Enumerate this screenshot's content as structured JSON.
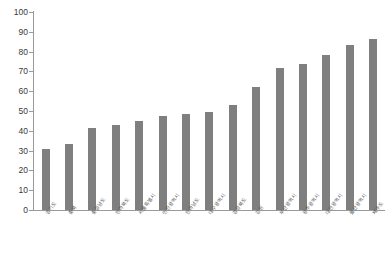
{
  "chart_data": {
    "type": "bar",
    "title": "",
    "subtitle": "",
    "xlabel": "",
    "ylabel": "",
    "ylim": [
      0,
      100
    ],
    "ytick_step": 10,
    "yticks": [
      0,
      10,
      20,
      30,
      40,
      50,
      60,
      70,
      80,
      90,
      100
    ],
    "grid": false,
    "legend": null,
    "bar_color": "#7f7f7f",
    "axis_color": "#9a9a9a",
    "tick_label_color": "#3a3a3a",
    "category_label_rotation_deg": -55,
    "categories": [
      "경기도",
      "충북",
      "충청남도",
      "전라북도",
      "서울특별시",
      "인천광역시",
      "전라남도",
      "대구광역시",
      "경상북도",
      "강원",
      "부산광역시",
      "광주광역시",
      "대전광역시",
      "울산광역시",
      "제주도"
    ],
    "values": [
      31,
      33.5,
      41.5,
      43,
      45,
      47.5,
      48.5,
      49.5,
      53,
      62,
      71.5,
      73.5,
      78.5,
      83.5,
      86.5
    ],
    "series": [
      {
        "name": "",
        "values": [
          31,
          33.5,
          41.5,
          43,
          45,
          47.5,
          48.5,
          49.5,
          53,
          62,
          71.5,
          73.5,
          78.5,
          83.5,
          86.5
        ]
      }
    ]
  }
}
